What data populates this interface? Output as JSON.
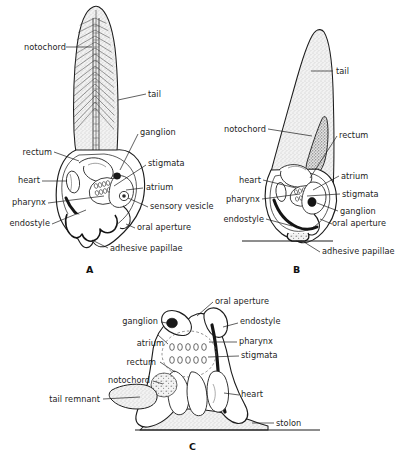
{
  "figure": {
    "type": "biological-diagram",
    "background_color": "#ffffff",
    "ink_color": "#1d1d1d",
    "tissue_fill": "#ececec",
    "stipple_color": "#8a8a8a"
  },
  "panels": [
    {
      "id": "A",
      "letter": "A",
      "labels_left": [
        {
          "key": "notochord",
          "text": "notochord"
        },
        {
          "key": "rectum",
          "text": "rectum"
        },
        {
          "key": "heart",
          "text": "heart"
        },
        {
          "key": "pharynx",
          "text": "pharynx"
        },
        {
          "key": "endostyle",
          "text": "endostyle"
        }
      ],
      "labels_right": [
        {
          "key": "tail",
          "text": "tail"
        },
        {
          "key": "ganglion",
          "text": "ganglion"
        },
        {
          "key": "stigmata",
          "text": "stigmata"
        },
        {
          "key": "atrium",
          "text": "atrium"
        },
        {
          "key": "sensory_vesicle",
          "text": "sensory vesicle"
        },
        {
          "key": "oral_aperture",
          "text": "oral aperture"
        },
        {
          "key": "adhesive_papillae",
          "text": "adhesive papillae"
        }
      ]
    },
    {
      "id": "B",
      "letter": "B",
      "labels_left": [
        {
          "key": "notochord",
          "text": "notochord"
        },
        {
          "key": "heart",
          "text": "heart"
        },
        {
          "key": "pharynx",
          "text": "pharynx"
        },
        {
          "key": "endostyle",
          "text": "endostyle"
        }
      ],
      "labels_right": [
        {
          "key": "tail",
          "text": "tail"
        },
        {
          "key": "rectum",
          "text": "rectum"
        },
        {
          "key": "atrium",
          "text": "atrium"
        },
        {
          "key": "stigmata",
          "text": "stigmata"
        },
        {
          "key": "ganglion",
          "text": "ganglion"
        },
        {
          "key": "oral_aperture",
          "text": "oral aperture"
        },
        {
          "key": "adhesive_papillae",
          "text": "adhesive papillae"
        }
      ]
    },
    {
      "id": "C",
      "letter": "C",
      "labels_left": [
        {
          "key": "ganglion",
          "text": "ganglion"
        },
        {
          "key": "atrium",
          "text": "atrium"
        },
        {
          "key": "rectum",
          "text": "rectum"
        },
        {
          "key": "notochord",
          "text": "notochord"
        },
        {
          "key": "tail_remnant",
          "text": "tail remnant"
        }
      ],
      "labels_right": [
        {
          "key": "oral_aperture",
          "text": "oral aperture"
        },
        {
          "key": "endostyle",
          "text": "endostyle"
        },
        {
          "key": "pharynx",
          "text": "pharynx"
        },
        {
          "key": "stigmata",
          "text": "stigmata"
        },
        {
          "key": "heart",
          "text": "heart"
        },
        {
          "key": "stolon",
          "text": "stolon"
        }
      ]
    }
  ],
  "labels": {
    "a_notochord": "notochord",
    "a_tail": "tail",
    "a_ganglion": "ganglion",
    "a_rectum": "rectum",
    "a_stigmata": "stigmata",
    "a_heart": "heart",
    "a_atrium": "atrium",
    "a_pharynx": "pharynx",
    "a_sensory_vesicle": "sensory vesicle",
    "a_endostyle": "endostyle",
    "a_oral_aperture": "oral aperture",
    "a_adhesive_papillae": "adhesive papillae",
    "a_letter": "A",
    "b_tail": "tail",
    "b_notochord": "notochord",
    "b_rectum": "rectum",
    "b_heart": "heart",
    "b_atrium": "atrium",
    "b_pharynx": "pharynx",
    "b_stigmata": "stigmata",
    "b_endostyle": "endostyle",
    "b_ganglion": "ganglion",
    "b_oral_aperture": "oral aperture",
    "b_adhesive_papillae": "adhesive papillae",
    "b_letter": "B",
    "c_oral_aperture": "oral aperture",
    "c_ganglion": "ganglion",
    "c_endostyle": "endostyle",
    "c_atrium": "atrium",
    "c_pharynx": "pharynx",
    "c_stigmata": "stigmata",
    "c_rectum": "rectum",
    "c_notochord": "notochord",
    "c_heart": "heart",
    "c_tail_remnant": "tail remnant",
    "c_stolon": "stolon",
    "c_letter": "C"
  }
}
